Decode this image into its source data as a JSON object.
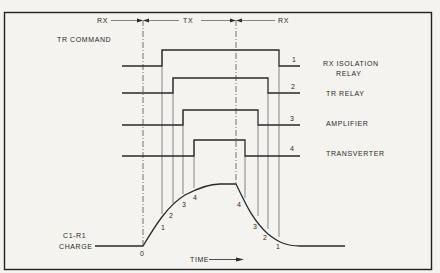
{
  "diagram": {
    "phases": [
      {
        "label": "RX",
        "id": "rx-start"
      },
      {
        "label": "TX",
        "id": "tx"
      },
      {
        "label": "RX",
        "id": "rx-end"
      }
    ],
    "command_label": "TR COMMAND",
    "channels": [
      {
        "number": "1",
        "label_line1": "RX ISOLATION",
        "label_line2": "RELAY"
      },
      {
        "number": "2",
        "label_line1": "TR RELAY",
        "label_line2": ""
      },
      {
        "number": "3",
        "label_line1": "AMPLIFIER",
        "label_line2": ""
      },
      {
        "number": "4",
        "label_line1": "TRANSVERTER",
        "label_line2": ""
      }
    ],
    "charge": {
      "label_line1": "C1-R1",
      "label_line2": "CHARGE",
      "origin_label": "0",
      "rise_marks": [
        "1",
        "2",
        "3",
        "4"
      ],
      "fall_marks": [
        "4",
        "3",
        "2",
        "1"
      ]
    },
    "time_axis_label": "TIME"
  }
}
